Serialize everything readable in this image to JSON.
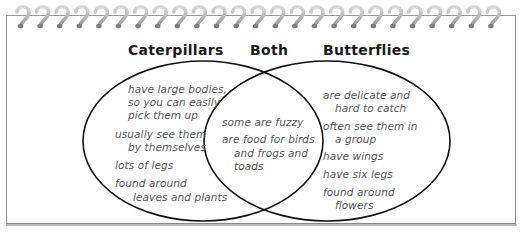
{
  "diagram": {
    "type": "venn",
    "headers": {
      "left": "Caterpillars",
      "center": "Both",
      "right": "Butterflies"
    },
    "left_items": [
      {
        "lines": [
          "have large bodies,",
          "so you can easily",
          "pick them up"
        ]
      },
      {
        "lines": [
          "usually see them",
          "by themselves"
        ]
      },
      {
        "lines": [
          "lots of legs"
        ]
      },
      {
        "lines": [
          "found around",
          "leaves and plants"
        ]
      }
    ],
    "both_items": [
      {
        "lines": [
          "some are fuzzy"
        ]
      },
      {
        "lines": [
          "are food for birds",
          "and frogs and",
          "toads"
        ]
      }
    ],
    "right_items": [
      {
        "lines": [
          "are delicate and",
          "hard to catch"
        ]
      },
      {
        "lines": [
          "often see them in",
          "a group"
        ]
      },
      {
        "lines": [
          "have wings"
        ]
      },
      {
        "lines": [
          "have six legs"
        ]
      },
      {
        "lines": [
          "found around",
          "flowers"
        ]
      }
    ],
    "colors": {
      "outline": "#111111",
      "text": "#555555",
      "header": "#1a1a1a",
      "frame": "#8a8a8a",
      "spiral": "#a8a8a8"
    },
    "spiral_count": 25
  }
}
